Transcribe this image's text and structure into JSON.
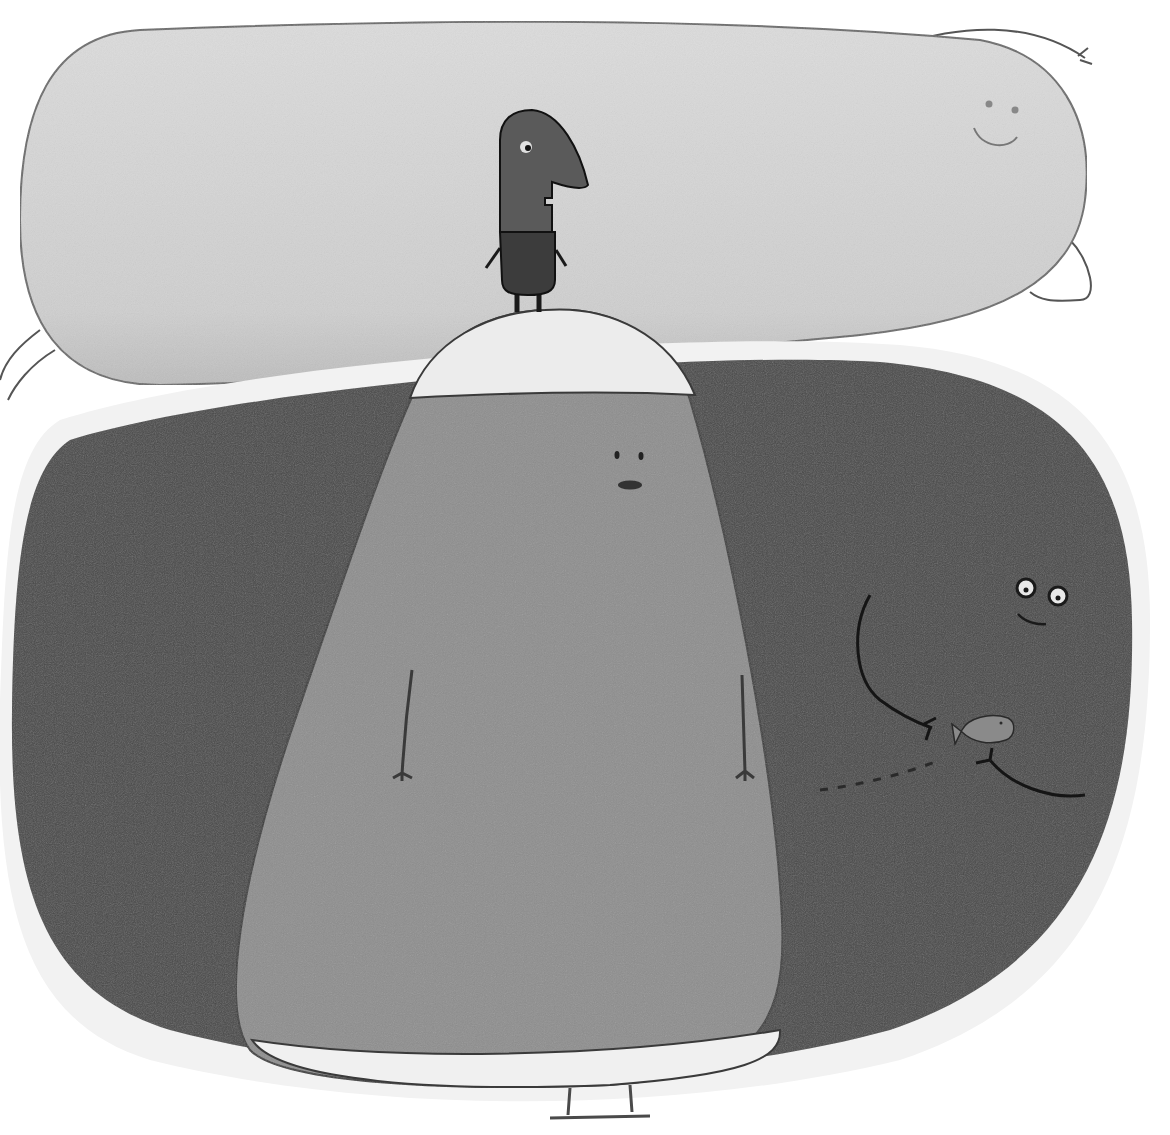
{
  "illustration": {
    "title": "Stacked blob creatures illustration",
    "style": "grayscale hand-drawn pencil",
    "colors": {
      "background": "#ffffff",
      "top_blob": "#d6d6d6",
      "big_dark_blob": "#4a4a4a",
      "middle_blob": "#8e8e8e",
      "middle_blob_cap": "#ececec",
      "small_bird": "#5a5a5a",
      "bird_body": "#3c3c3c",
      "fish": "#8a8a8a",
      "line": "#2a2a2a"
    },
    "characters": [
      {
        "name": "top-blob",
        "expression": "smile"
      },
      {
        "name": "small-bird-character",
        "expression": "neutral"
      },
      {
        "name": "middle-blob",
        "expression": "pursed"
      },
      {
        "name": "big-dark-blob",
        "expression": "smile",
        "holding": "fish"
      }
    ]
  }
}
